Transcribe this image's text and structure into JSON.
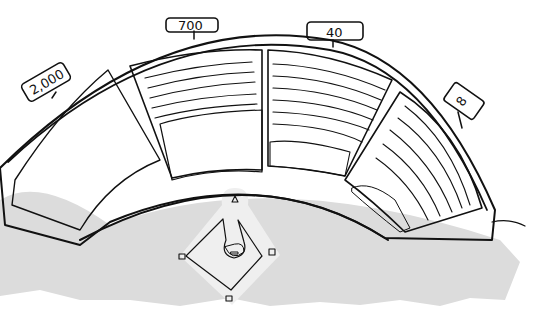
{
  "illustration": {
    "subject": "Baseball stadium with four seating sections showing decreasing crowd sizes",
    "colors": {
      "background": "#ffffff",
      "field": "#dcdcdc",
      "infield_dirt": "#a9a9a9",
      "infield_light": "#ececec",
      "seat_panel": "#d6d6d6",
      "crowd_dark": "#3a3a3a",
      "crowd_mid": "#6a6a6a",
      "ink": "#111111"
    }
  },
  "sections": [
    {
      "id": "section-1",
      "sign": "2,000",
      "crowd_level": "full"
    },
    {
      "id": "section-2",
      "sign": "700",
      "crowd_level": "partial"
    },
    {
      "id": "section-3",
      "sign": "40",
      "crowd_level": "few"
    },
    {
      "id": "section-4",
      "sign": "8",
      "crowd_level": "very-few"
    }
  ]
}
